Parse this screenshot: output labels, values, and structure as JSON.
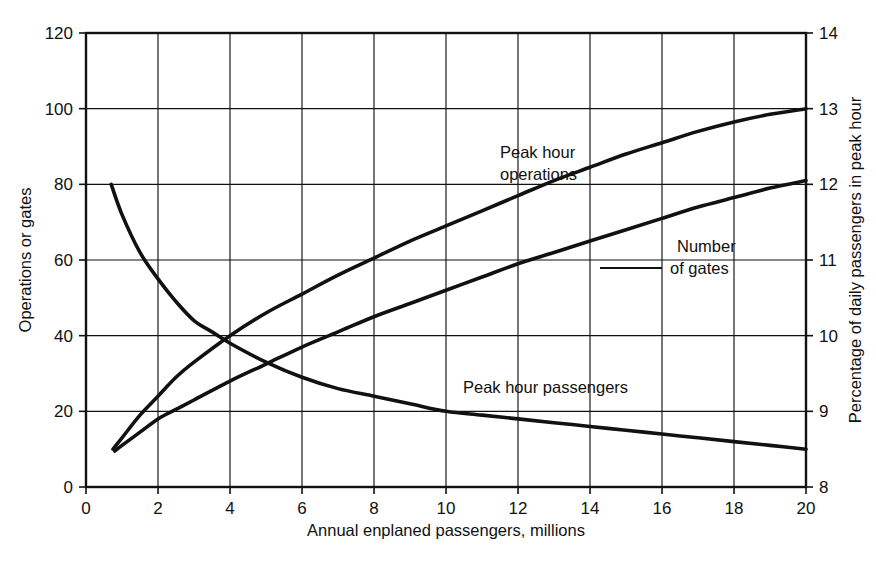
{
  "chart_data": {
    "type": "line",
    "title": "",
    "subtitle": "",
    "xlabel": "Annual enplaned passengers, millions",
    "ylabel": "Operations or gates",
    "y2label": "Percentage of daily passengers in peak hour",
    "xlim": [
      0,
      20
    ],
    "ylim": [
      0,
      120
    ],
    "y2lim": [
      8,
      14
    ],
    "xticks": [
      "0",
      "2",
      "4",
      "6",
      "8",
      "10",
      "12",
      "14",
      "16",
      "18",
      "20"
    ],
    "xtick_values": [
      0,
      2,
      4,
      6,
      8,
      10,
      12,
      14,
      16,
      18,
      20
    ],
    "yticks": [
      "0",
      "20",
      "40",
      "60",
      "80",
      "100",
      "120"
    ],
    "ytick_values": [
      0,
      20,
      40,
      60,
      80,
      100,
      120
    ],
    "y2ticks": [
      "8",
      "9",
      "10",
      "11",
      "12",
      "13",
      "14"
    ],
    "y2tick_values": [
      8,
      9,
      10,
      11,
      12,
      13,
      14
    ],
    "grid": true,
    "legend_position": "inline-annotations",
    "series": [
      {
        "name": "Peak hour operations",
        "axis": "left",
        "label_position": "upper-center",
        "x": [
          0.75,
          1,
          1.5,
          2,
          2.5,
          3,
          4,
          5,
          6,
          7,
          8,
          9,
          10,
          11,
          12,
          13,
          14,
          15,
          16,
          17,
          18,
          19,
          20
        ],
        "values": [
          10,
          13,
          19,
          24,
          29,
          33,
          40,
          46,
          51,
          56,
          60.5,
          65,
          69,
          73,
          77,
          81,
          84.5,
          88,
          91,
          94,
          96.5,
          98.5,
          100
        ]
      },
      {
        "name": "Number of gates",
        "axis": "left",
        "label_position": "right-center",
        "x": [
          0.8,
          1,
          1.5,
          2,
          2.5,
          3,
          4,
          5,
          6,
          7,
          8,
          9,
          10,
          11,
          12,
          13,
          14,
          15,
          16,
          17,
          18,
          19,
          20
        ],
        "values": [
          9.5,
          11,
          14.5,
          18,
          20.5,
          23,
          28,
          32.5,
          37,
          41,
          45,
          48.5,
          52,
          55.5,
          59,
          62,
          65,
          68,
          71,
          74,
          76.5,
          79,
          81
        ]
      },
      {
        "name": "Peak hour passengers",
        "axis": "right",
        "label_position": "lower-center",
        "x": [
          0.7,
          1,
          1.5,
          2,
          2.5,
          3,
          3.5,
          4,
          5,
          6,
          7,
          8,
          9,
          10,
          11,
          12,
          13,
          14,
          15,
          16,
          17,
          18,
          19,
          20
        ],
        "values": [
          12.0,
          11.6,
          11.1,
          10.75,
          10.45,
          10.2,
          10.05,
          9.9,
          9.65,
          9.45,
          9.3,
          9.2,
          9.1,
          9.0,
          8.95,
          8.9,
          8.85,
          8.8,
          8.75,
          8.7,
          8.65,
          8.6,
          8.55,
          8.5
        ]
      }
    ],
    "annotations": [
      {
        "text_line_1": "Peak hour",
        "text_line_2": "operations"
      },
      {
        "text_line_1": "Number",
        "text_line_2": "of gates"
      },
      {
        "text_line_1": "Peak hour passengers",
        "text_line_2": ""
      }
    ],
    "colors": {
      "ink": "#111111",
      "background": "#ffffff"
    }
  },
  "labels": {
    "x_axis_title": "Annual enplaned passengers, millions",
    "y_axis_title": "Operations or gates",
    "y2_axis_title": "Percentage of daily passengers in peak hour",
    "series_operations_line1": "Peak hour",
    "series_operations_line2": "operations",
    "series_gates_line1": "Number",
    "series_gates_line2": "of gates",
    "series_passengers": "Peak hour passengers"
  },
  "ticks": {
    "x": [
      "0",
      "2",
      "4",
      "6",
      "8",
      "10",
      "12",
      "14",
      "16",
      "18",
      "20"
    ],
    "y_left": [
      "0",
      "20",
      "40",
      "60",
      "80",
      "100",
      "120"
    ],
    "y_right": [
      "8",
      "9",
      "10",
      "11",
      "12",
      "13",
      "14"
    ]
  }
}
